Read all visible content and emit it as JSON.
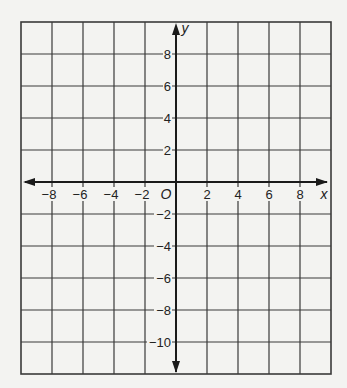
{
  "chart_data": {
    "type": "coordinate-grid",
    "title": "",
    "xlabel": "x",
    "ylabel": "y",
    "origin_label": "O",
    "xlim": [
      -10,
      10
    ],
    "ylim": [
      -12,
      10
    ],
    "grid": true,
    "grid_step": 2,
    "x_ticks": [
      -8,
      -6,
      -4,
      -2,
      2,
      4,
      6,
      8
    ],
    "x_tick_labels": [
      "−8",
      "−6",
      "−4",
      "−2",
      "2",
      "4",
      "6",
      "8"
    ],
    "y_ticks": [
      8,
      6,
      4,
      2,
      -2,
      -4,
      -6,
      -8,
      -10
    ],
    "y_tick_labels": [
      "8",
      "6",
      "4",
      "2",
      "−2",
      "−4",
      "−6",
      "−8",
      "−10"
    ],
    "series": []
  },
  "layout": {
    "left": 21,
    "top": 22,
    "right": 331,
    "bottom": 374,
    "origin_x": 176,
    "origin_y": 182,
    "unit_x": 15.5,
    "unit_y": 16,
    "line_color": "#3a3a3a",
    "axis_color": "#1a1a1a"
  }
}
